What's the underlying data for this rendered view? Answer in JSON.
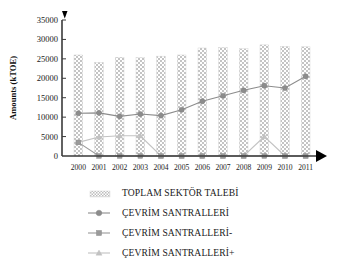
{
  "chart_data": {
    "type": "bar",
    "title": "",
    "xlabel": "",
    "ylabel": "Amounts  (kTOE)",
    "ylim": [
      0,
      35000
    ],
    "ytick_step": 5000,
    "yticks": [
      "0",
      "5000",
      "10000",
      "15000",
      "20000",
      "25000",
      "30000",
      "35000"
    ],
    "grid": false,
    "legend_position": "bottom",
    "categories": [
      "2000",
      "2001",
      "2002",
      "2003",
      "2004",
      "2005",
      "2006",
      "2007",
      "2008",
      "2009",
      "2010",
      "2011"
    ],
    "series": [
      {
        "name": "TOPLAM SEKTÖR TALEBİ",
        "type": "bar",
        "marker": "hatched-square",
        "color": "#b9b9b9",
        "values": [
          26000,
          24100,
          25400,
          25300,
          25700,
          26000,
          27800,
          27900,
          27600,
          28600,
          28200,
          28100
        ]
      },
      {
        "name": "ÇEVRİM SANTRALLERİ",
        "type": "line",
        "marker": "circle",
        "color": "#8c8c8c",
        "values": [
          11000,
          11100,
          10200,
          10800,
          10400,
          11900,
          14100,
          15500,
          16900,
          18100,
          17500,
          20500
        ]
      },
      {
        "name": "ÇEVRİM SANTRALLERİ-",
        "type": "line",
        "marker": "square",
        "color": "#9a9a9a",
        "values": [
          3500,
          0,
          0,
          0,
          0,
          0,
          0,
          0,
          0,
          0,
          0,
          0
        ]
      },
      {
        "name": "ÇEVRİM SANTRALLERİ+",
        "type": "line",
        "marker": "triangle",
        "color": "#c2c2c2",
        "values": [
          3500,
          4900,
          5200,
          5200,
          0,
          0,
          0,
          0,
          0,
          5000,
          0,
          0
        ]
      }
    ]
  },
  "axes": {
    "y_label": "Amounts  (kTOE)",
    "y_ticks": [
      "35000",
      "30000",
      "25000",
      "20000",
      "15000",
      "10000",
      "5000",
      "0"
    ],
    "x_ticks": [
      "2000",
      "2001",
      "2002",
      "2003",
      "2004",
      "2005",
      "2006",
      "2007",
      "2008",
      "2009",
      "2010",
      "2011"
    ],
    "y_arrow": "up-arrow-icon",
    "x_arrow": "right-arrow-icon"
  },
  "legend": {
    "items": [
      {
        "label": "TOPLAM SEKTÖR TALEBİ",
        "marker": "hatched-swatch"
      },
      {
        "label": "ÇEVRİM SANTRALLERİ",
        "marker": "circle"
      },
      {
        "label": "ÇEVRİM SANTRALLERİ-",
        "marker": "square"
      },
      {
        "label": "ÇEVRİM SANTRALLERİ+",
        "marker": "triangle"
      }
    ]
  },
  "colors": {
    "bar": "#b9b9b9",
    "line_circle": "#8c8c8c",
    "line_square": "#9a9a9a",
    "line_triangle": "#c2c2c2",
    "axis": "#3a3a3a",
    "text": "#1a1a1a"
  }
}
